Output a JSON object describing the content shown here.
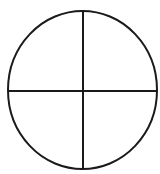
{
  "diagram": {
    "shape": "circle-divided-into-quadrants",
    "stroke_color": "#1a1a1a",
    "background_color": "#ffffff",
    "stroke_width": 2,
    "ellipse": {
      "cx": 82.5,
      "cy": 90,
      "rx": 74.5,
      "ry": 79
    },
    "vertical_divider": {
      "x": 83,
      "y1": 11,
      "y2": 169
    },
    "horizontal_divider": {
      "y": 91,
      "x1": 8,
      "x2": 157
    },
    "quadrants": 4
  }
}
